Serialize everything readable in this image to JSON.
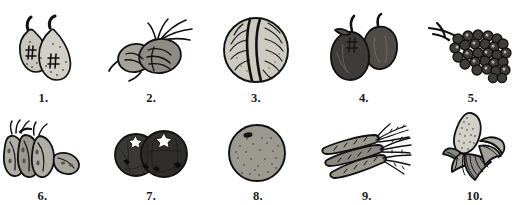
{
  "page": {
    "background_color": "#ffffff",
    "ink_color": "#111111",
    "rows": 2,
    "columns": 5
  },
  "palette": {
    "outline": "#111111",
    "light_fill": "#c9c6bd",
    "mid_fill": "#8e8b84",
    "dark_fill": "#4a4845",
    "very_dark_fill": "#33312f",
    "paper": "#ffffff"
  },
  "items": [
    {
      "number": "1.",
      "subject": "pears",
      "icon": "pear-pair-icon",
      "shade": "light",
      "count": 2
    },
    {
      "number": "2.",
      "subject": "beets",
      "icon": "beet-pair-icon",
      "shade": "mid",
      "count": 2
    },
    {
      "number": "3.",
      "subject": "cabbage",
      "icon": "cabbage-icon",
      "shade": "light",
      "count": 1
    },
    {
      "number": "4.",
      "subject": "apples",
      "icon": "apple-pair-icon",
      "shade": "dark",
      "count": 2
    },
    {
      "number": "5.",
      "subject": "grapes",
      "icon": "grape-bunch-icon",
      "shade": "dark",
      "count": 1
    },
    {
      "number": "6.",
      "subject": "pea pods",
      "icon": "pea-pods-icon",
      "shade": "mid",
      "count": 4
    },
    {
      "number": "7.",
      "subject": "tomatoes",
      "icon": "tomato-pair-icon",
      "shade": "very-dark",
      "count": 2
    },
    {
      "number": "8.",
      "subject": "orange",
      "icon": "orange-icon",
      "shade": "mid",
      "count": 1
    },
    {
      "number": "9.",
      "subject": "carrots",
      "icon": "carrot-bunch-icon",
      "shade": "mid",
      "count": 3
    },
    {
      "number": "10.",
      "subject": "corn on the cob",
      "icon": "corn-cob-icon",
      "shade": "light",
      "count": 1
    }
  ]
}
